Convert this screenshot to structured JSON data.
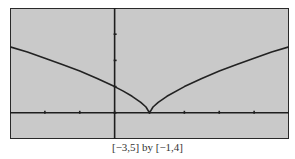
{
  "chart_data": {
    "type": "line",
    "title": "",
    "xlabel": "",
    "ylabel": "",
    "xlim": [
      -3,
      5
    ],
    "ylim": [
      -1,
      4
    ],
    "xscale": 1,
    "yscale": 1,
    "grid": false,
    "legend": null,
    "function_estimate": "y = |x - 1|^(2/3)",
    "series": [
      {
        "name": "graph",
        "x": [
          -3,
          -2.5,
          -2,
          -1.5,
          -1,
          -0.5,
          0,
          0.25,
          0.5,
          0.75,
          0.9,
          1,
          1.1,
          1.25,
          1.5,
          2,
          2.5,
          3,
          3.5,
          4,
          4.5,
          5
        ],
        "y": [
          2.52,
          2.32,
          2.08,
          1.84,
          1.59,
          1.31,
          1.0,
          0.83,
          0.63,
          0.4,
          0.22,
          0.0,
          0.22,
          0.4,
          0.63,
          1.0,
          1.31,
          1.59,
          1.84,
          2.08,
          2.32,
          2.52
        ]
      }
    ],
    "vertex": {
      "x": 1,
      "y": 0
    },
    "x_ticks": [
      -3,
      -2,
      -1,
      0,
      1,
      2,
      3,
      4,
      5
    ],
    "y_ticks": [
      -1,
      0,
      1,
      2,
      3,
      4
    ]
  },
  "caption": "[−3,5] by [−1,4]",
  "colors": {
    "screen_bg": "#c9c9c9",
    "line": "#222222",
    "frame": "#2a2a2a"
  }
}
